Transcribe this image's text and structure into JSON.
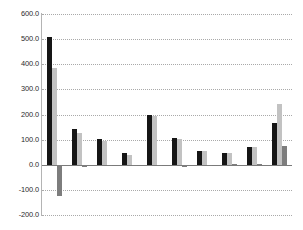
{
  "chart_data": {
    "type": "bar",
    "title": "",
    "subtitle": "",
    "xlabel": "",
    "ylabel": "",
    "ylim": [
      -200,
      600
    ],
    "ytick_labels": [
      "600.0",
      "500.0",
      "400.0",
      "300.0",
      "200.0",
      "100.0",
      "0.0",
      "-100.0",
      "-200.0"
    ],
    "ytick_values": [
      600,
      500,
      400,
      300,
      200,
      100,
      0,
      -100,
      -200
    ],
    "grid": true,
    "grid_axis": "y",
    "grid_style": "dotted",
    "legend": false,
    "legend_position": "none",
    "xtick_labels": [
      "",
      "",
      "",
      "",
      "",
      "",
      "",
      "",
      "",
      ""
    ],
    "categories": [
      "1",
      "2",
      "3",
      "4",
      "5",
      "6",
      "7",
      "8",
      "9",
      "10"
    ],
    "series": [
      {
        "name": "Series 1",
        "color": "#161616",
        "values": [
          508,
          141,
          102,
          46,
          198,
          108,
          55,
          48,
          69,
          167
        ]
      },
      {
        "name": "Series 2",
        "color": "#c2c2c2",
        "values": [
          385,
          128,
          95,
          38,
          195,
          103,
          53,
          48,
          71,
          242
        ]
      },
      {
        "name": "Series 3",
        "color": "#7d7d7d",
        "values": [
          -125,
          -8,
          -6,
          -5,
          -5,
          -7,
          -4,
          1,
          2,
          75
        ]
      }
    ]
  },
  "axis": {
    "line_color": "#b4b4b4",
    "grid_color": "#a9a9a9",
    "zero_line_color": "#7a7a7a"
  }
}
